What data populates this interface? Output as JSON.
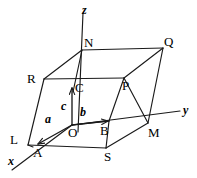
{
  "figure": {
    "width": 197,
    "height": 178,
    "background_color": "#ffffff",
    "line_color": "#1a1a1a",
    "text_color": "#000000"
  },
  "axes": [
    {
      "name": "z-axis",
      "label": "z",
      "label_x": 82,
      "label_y": 4,
      "x1": 83,
      "y1": 13,
      "x2": 78,
      "y2": 132
    },
    {
      "name": "y-axis",
      "label": "y",
      "label_x": 183,
      "label_y": 104,
      "x1": 72,
      "y1": 125,
      "x2": 180,
      "y2": 111
    },
    {
      "name": "x-axis",
      "label": "x",
      "label_x": 8,
      "label_y": 155,
      "x1": 72,
      "y1": 125,
      "x2": 12,
      "y2": 170
    }
  ],
  "vertices": [
    {
      "name": "O",
      "label": "O",
      "px": 72,
      "py": 125,
      "label_x": 68,
      "label_y": 126
    },
    {
      "name": "A",
      "label": "A",
      "px": 33,
      "py": 147,
      "label_x": 33,
      "label_y": 146
    },
    {
      "name": "B",
      "label": "B",
      "px": 109,
      "py": 121,
      "label_x": 100,
      "label_y": 124
    },
    {
      "name": "C",
      "label": "C",
      "px": 73,
      "py": 87,
      "label_x": 75,
      "label_y": 81
    },
    {
      "name": "L",
      "label": "L",
      "px": 28,
      "py": 145,
      "label_x": 10,
      "label_y": 133
    },
    {
      "name": "M",
      "label": "M",
      "px": 148,
      "py": 123,
      "label_x": 148,
      "label_y": 126
    },
    {
      "name": "N",
      "label": "N",
      "px": 82,
      "py": 50,
      "label_x": 84,
      "label_y": 36
    },
    {
      "name": "P",
      "label": "P",
      "px": 124,
      "py": 78,
      "label_x": 122,
      "label_y": 79
    },
    {
      "name": "Q",
      "label": "Q",
      "px": 163,
      "py": 48,
      "label_x": 164,
      "label_y": 35
    },
    {
      "name": "R",
      "label": "R",
      "px": 44,
      "py": 79,
      "label_x": 27,
      "label_y": 72
    },
    {
      "name": "S",
      "label": "S",
      "px": 106,
      "py": 148,
      "label_x": 104,
      "label_y": 150
    }
  ],
  "vectors": [
    {
      "name": "a",
      "label": "a",
      "x1": 72,
      "y1": 125,
      "x2": 38,
      "y2": 144,
      "label_x": 45,
      "label_y": 113
    },
    {
      "name": "b",
      "label": "b",
      "x1": 72,
      "y1": 125,
      "x2": 108,
      "y2": 121,
      "label_x": 80,
      "label_y": 106
    },
    {
      "name": "c",
      "label": "c",
      "x1": 72,
      "y1": 125,
      "x2": 72,
      "y2": 88,
      "label_x": 61,
      "label_y": 100
    }
  ],
  "edges": [
    {
      "name": "edge-L-R",
      "x1": 28,
      "y1": 145,
      "x2": 44,
      "y2": 79
    },
    {
      "name": "edge-R-N",
      "x1": 44,
      "y1": 79,
      "x2": 82,
      "y2": 50
    },
    {
      "name": "edge-N-Q",
      "x1": 82,
      "y1": 50,
      "x2": 163,
      "y2": 48
    },
    {
      "name": "edge-Q-M",
      "x1": 163,
      "y1": 48,
      "x2": 148,
      "y2": 123
    },
    {
      "name": "edge-M-S",
      "x1": 148,
      "y1": 123,
      "x2": 106,
      "y2": 148
    },
    {
      "name": "edge-S-L",
      "x1": 106,
      "y1": 148,
      "x2": 28,
      "y2": 145
    },
    {
      "name": "edge-R-P",
      "x1": 44,
      "y1": 79,
      "x2": 124,
      "y2": 78
    },
    {
      "name": "edge-P-Q",
      "x1": 124,
      "y1": 78,
      "x2": 163,
      "y2": 48
    },
    {
      "name": "edge-P-M",
      "x1": 124,
      "y1": 78,
      "x2": 148,
      "y2": 123
    },
    {
      "name": "edge-O-B",
      "x1": 72,
      "y1": 125,
      "x2": 109,
      "y2": 121
    },
    {
      "name": "edge-B-S",
      "x1": 109,
      "y1": 121,
      "x2": 106,
      "y2": 148
    },
    {
      "name": "edge-B-P",
      "x1": 109,
      "y1": 121,
      "x2": 124,
      "y2": 78
    },
    {
      "name": "edge-N-C",
      "x1": 82,
      "y1": 50,
      "x2": 73,
      "y2": 92
    },
    {
      "name": "edge-A-L",
      "x1": 33,
      "y1": 147,
      "x2": 28,
      "y2": 145
    }
  ]
}
